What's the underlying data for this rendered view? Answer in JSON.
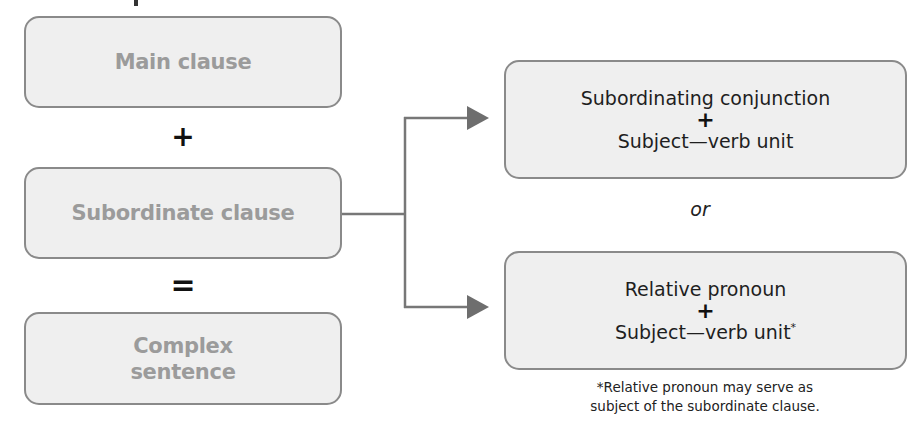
{
  "diagram": {
    "left_column": {
      "boxes": [
        {
          "label": "Main clause"
        },
        {
          "label": "Subordinate clause"
        },
        {
          "label_line1": "Complex",
          "label_line2": "sentence"
        }
      ],
      "operators": {
        "plus": "+",
        "equals": "="
      }
    },
    "right_column": {
      "options": [
        {
          "line1": "Subordinating conjunction",
          "plus": "+",
          "line2": "Subject—verb unit",
          "marker": ""
        },
        {
          "line1": "Relative pronoun",
          "plus": "+",
          "line2": "Subject—verb unit",
          "marker": "*"
        }
      ],
      "separator": "or",
      "footnote_line1": "*Relative pronoun may serve as",
      "footnote_line2": "subject of the subordinate clause."
    },
    "colors": {
      "box_fill": "#efefef",
      "box_border": "#8a8a8a",
      "left_text": "#9b9b9b",
      "connector": "#777777",
      "right_text": "#1e1e1e"
    }
  }
}
